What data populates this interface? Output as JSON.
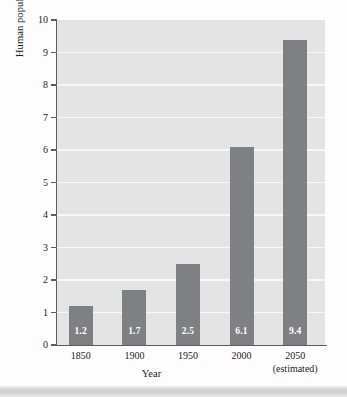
{
  "chart_data": {
    "type": "bar",
    "title": "",
    "xlabel": "Year",
    "ylabel": "Human population (billions)",
    "categories": [
      "1850",
      "1900",
      "1950",
      "2000",
      "2050"
    ],
    "category_sublabels": [
      "",
      "",
      "",
      "",
      "(estimated)"
    ],
    "values": [
      1.2,
      1.7,
      2.5,
      6.1,
      9.4
    ],
    "data_labels": [
      "1.2",
      "1.7",
      "2.5",
      "6.1",
      "9.4"
    ],
    "ylim": [
      0,
      10
    ],
    "ytick_labels": [
      "0",
      "1",
      "2",
      "3",
      "4",
      "5",
      "6",
      "7",
      "8",
      "9",
      "10"
    ],
    "ytick_values": [
      0,
      1,
      2,
      3,
      4,
      5,
      6,
      7,
      8,
      9,
      10
    ],
    "grid": true,
    "grid_axis": "y",
    "legend": false,
    "colors": {
      "bar": "#7f8083",
      "plot_background": "#e4e4e4",
      "gridline": "#f7f7f7",
      "axis": "#5d5d5d",
      "data_label_text": "#ffffff",
      "tick_text": "#1c1c1c",
      "figure_background": "#fdfdfd"
    }
  }
}
